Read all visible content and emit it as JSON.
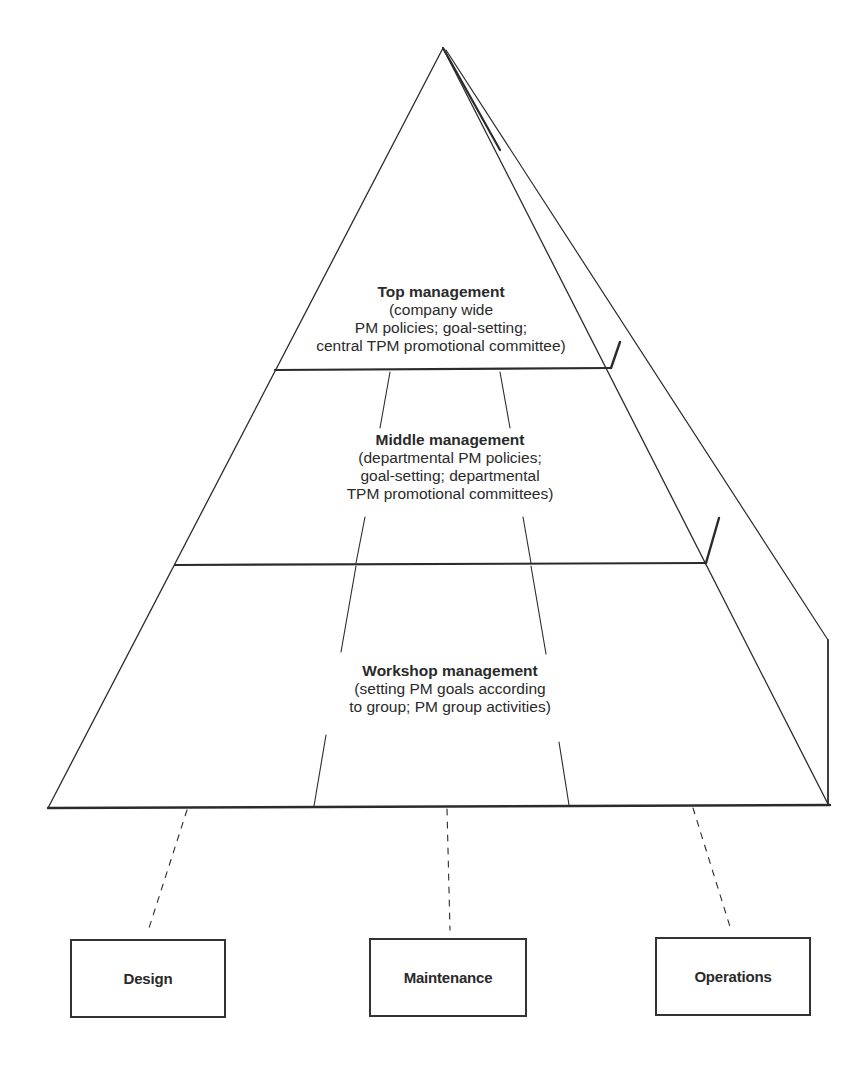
{
  "diagram": {
    "type": "pyramid",
    "levels": [
      {
        "id": "top",
        "title": "Top management",
        "description_lines": [
          "(company wide",
          "PM policies; goal-setting;",
          "central TPM promotional committee)"
        ]
      },
      {
        "id": "middle",
        "title": "Middle management",
        "description_lines": [
          "(departmental PM policies;",
          "goal-setting; departmental",
          "TPM promotional committees)"
        ]
      },
      {
        "id": "workshop",
        "title": "Workshop management",
        "description_lines": [
          "(setting PM goals according",
          "to group; PM group activities)"
        ]
      }
    ],
    "departments": [
      {
        "id": "design",
        "label": "Design"
      },
      {
        "id": "maintenance",
        "label": "Maintenance"
      },
      {
        "id": "operations",
        "label": "Operations"
      }
    ],
    "colors": {
      "line": "#2b2b2b",
      "background": "#ffffff",
      "text": "#2a2a2a"
    }
  }
}
